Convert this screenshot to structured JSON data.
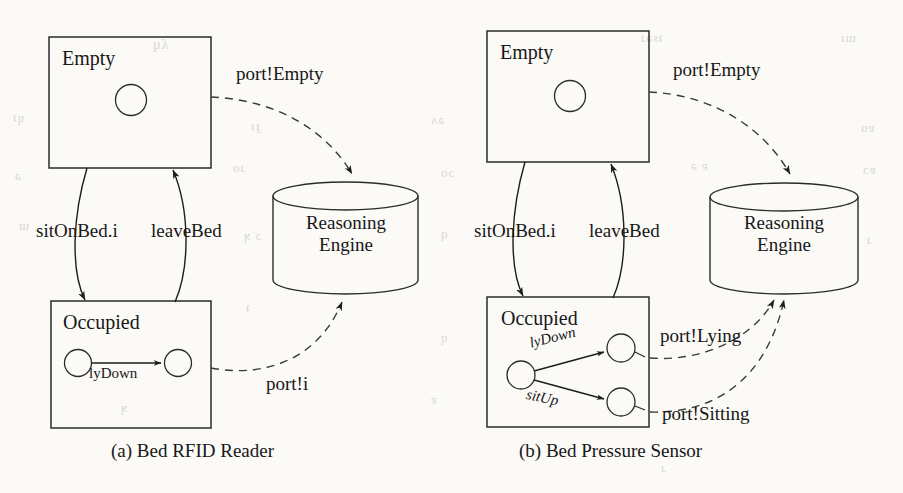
{
  "figure": {
    "panels": [
      {
        "id": "a",
        "caption": "(a) Bed RFID Reader",
        "states": {
          "empty": {
            "label": "Empty"
          },
          "occupied": {
            "label": "Occupied"
          }
        },
        "component": {
          "line1": "Reasoning",
          "line2": "Engine"
        },
        "transitions": [
          {
            "name": "sitOnBed.i",
            "direction": "empty-to-occupied"
          },
          {
            "name": "leaveBed",
            "direction": "occupied-to-empty"
          }
        ],
        "inner_transitions": [
          {
            "name": "lyDown",
            "from": "occupied-node-1",
            "to": "occupied-node-2"
          }
        ],
        "messages": [
          {
            "name": "port!Empty",
            "from": "empty",
            "to": "reasoning-engine"
          },
          {
            "name": "port!i",
            "from": "occupied",
            "to": "reasoning-engine"
          }
        ]
      },
      {
        "id": "b",
        "caption": "(b) Bed Pressure Sensor",
        "states": {
          "empty": {
            "label": "Empty"
          },
          "occupied": {
            "label": "Occupied"
          }
        },
        "component": {
          "line1": "Reasoning",
          "line2": "Engine"
        },
        "transitions": [
          {
            "name": "sitOnBed.i",
            "direction": "empty-to-occupied"
          },
          {
            "name": "leaveBed",
            "direction": "occupied-to-empty"
          }
        ],
        "inner_transitions": [
          {
            "name": "lyDown",
            "from": "occupied-node-src",
            "to": "occupied-node-lying"
          },
          {
            "name": "sitUp",
            "from": "occupied-node-src",
            "to": "occupied-node-sitting"
          }
        ],
        "messages": [
          {
            "name": "port!Empty",
            "from": "empty",
            "to": "reasoning-engine"
          },
          {
            "name": "port!Lying",
            "from": "occupied",
            "to": "reasoning-engine"
          },
          {
            "name": "port!Sitting",
            "from": "occupied",
            "to": "reasoning-engine"
          }
        ]
      }
    ],
    "colors": {
      "ink": "#171717",
      "paper": "#fbfaf7",
      "stroke": "#2a2a2a"
    }
  }
}
